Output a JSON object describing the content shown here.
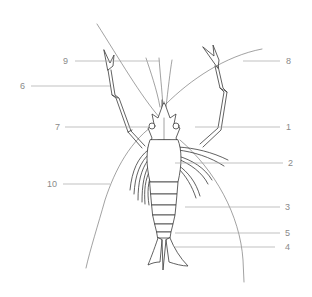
{
  "diagram": {
    "colors": {
      "ink": "#3a3a3a",
      "leader": "#a8a8a8",
      "label": "#8a8a8a",
      "background": "#ffffff"
    },
    "labels": [
      {
        "id": "1",
        "text": "1",
        "side": "right",
        "x": 286,
        "y": 122
      },
      {
        "id": "2",
        "text": "2",
        "side": "right",
        "x": 288,
        "y": 158
      },
      {
        "id": "3",
        "text": "3",
        "side": "right",
        "x": 285,
        "y": 202
      },
      {
        "id": "4",
        "text": "4",
        "side": "right",
        "x": 285,
        "y": 242
      },
      {
        "id": "5",
        "text": "5",
        "side": "right",
        "x": 285,
        "y": 228
      },
      {
        "id": "6",
        "text": "6",
        "side": "left",
        "x": 20,
        "y": 81
      },
      {
        "id": "7",
        "text": "7",
        "side": "left",
        "x": 55,
        "y": 122
      },
      {
        "id": "8",
        "text": "8",
        "side": "right",
        "x": 286,
        "y": 56
      },
      {
        "id": "9",
        "text": "9",
        "side": "left",
        "x": 63,
        "y": 56
      },
      {
        "id": "10",
        "text": "10",
        "side": "left",
        "x": 47,
        "y": 179
      }
    ]
  }
}
